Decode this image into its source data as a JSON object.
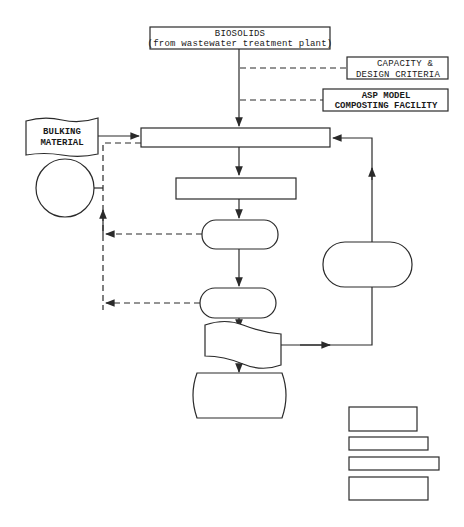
{
  "diagram": {
    "type": "flowchart",
    "colors": {
      "stroke": "#2a2a2a",
      "background": "#ffffff"
    },
    "nodes": {
      "biosolids": {
        "line1": "BIOSOLIDS",
        "line2": "(from wastewater treatment plant)"
      },
      "capacity": {
        "line1": "CAPACITY &",
        "line2": "DESIGN CRITERIA"
      },
      "asp_model": {
        "line1": "ASP MODEL",
        "line2": "COMPOSTING FACILITY"
      },
      "bulking": {
        "line1": "BULKING",
        "line2": "MATERIAL"
      },
      "mixing_box": {
        "label": ""
      },
      "process_box": {
        "label": ""
      },
      "pill_1": {
        "label": ""
      },
      "pill_2": {
        "label": ""
      },
      "pill_right": {
        "label": ""
      },
      "wavy_doc": {
        "label": ""
      },
      "barrel": {
        "label": ""
      },
      "circle": {
        "label": ""
      },
      "legend_boxes": [
        "",
        "",
        "",
        ""
      ]
    }
  }
}
